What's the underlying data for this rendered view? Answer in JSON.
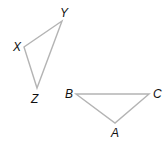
{
  "figure": {
    "triangles": [
      {
        "name": "XYZ",
        "vertices": [
          {
            "label": "Y",
            "x": 62,
            "y": 21,
            "lx": 60,
            "ly": 17
          },
          {
            "label": "X",
            "x": 24,
            "y": 47,
            "lx": 13,
            "ly": 51
          },
          {
            "label": "Z",
            "x": 37,
            "y": 88,
            "lx": 31,
            "ly": 103
          }
        ]
      },
      {
        "name": "ABC",
        "vertices": [
          {
            "label": "B",
            "x": 76,
            "y": 94,
            "lx": 65,
            "ly": 98
          },
          {
            "label": "C",
            "x": 149,
            "y": 94,
            "lx": 153,
            "ly": 98
          },
          {
            "label": "A",
            "x": 115,
            "y": 123,
            "lx": 111,
            "ly": 137
          }
        ]
      }
    ],
    "line_color": "#b4b4b4"
  }
}
